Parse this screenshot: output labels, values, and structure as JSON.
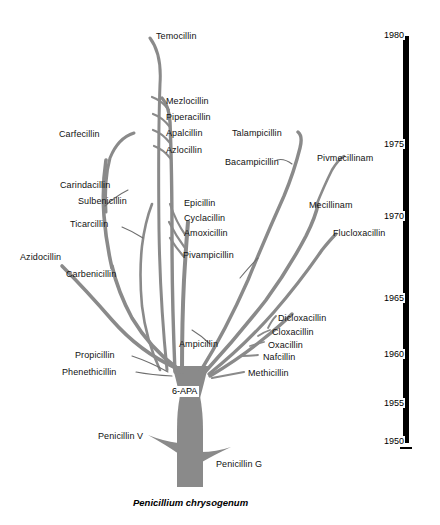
{
  "figure": {
    "title": "",
    "root_label": "Penicillium chrysogenum",
    "core_label": "6-APA",
    "branch_color": "#8a8a8a",
    "leader_color": "#6e6e6e",
    "text_color": "#111111",
    "timeline_color": "#000000",
    "background": "#ffffff"
  },
  "timeline": {
    "orientation": "vertical",
    "years": [
      "1980",
      "1975",
      "1970",
      "1965",
      "1960",
      "1955",
      "1950"
    ],
    "ticks": [
      {
        "label": "1980",
        "y": 36
      },
      {
        "label": "1975",
        "y": 145
      },
      {
        "label": "1970",
        "y": 217
      },
      {
        "label": "1965",
        "y": 299
      },
      {
        "label": "1960",
        "y": 355
      },
      {
        "label": "1955",
        "y": 404
      },
      {
        "label": "1950",
        "y": 442
      }
    ]
  },
  "labels": [
    {
      "name": "temocillin",
      "text": "Temocillin",
      "x": 156,
      "y": 31,
      "align": "left"
    },
    {
      "name": "mezlocillin",
      "text": "Mezlocillin",
      "x": 166,
      "y": 96,
      "align": "left"
    },
    {
      "name": "piperacillin",
      "text": "Piperacillin",
      "x": 166,
      "y": 112,
      "align": "left"
    },
    {
      "name": "apalcillin",
      "text": "Apalcillin",
      "x": 166,
      "y": 128,
      "align": "left"
    },
    {
      "name": "azlocillin",
      "text": "Azlocillin",
      "x": 166,
      "y": 145,
      "align": "left"
    },
    {
      "name": "carfecillin",
      "text": "Carfecillin",
      "x": 59,
      "y": 129,
      "align": "left"
    },
    {
      "name": "carindacillin",
      "text": "Carindacillin",
      "x": 60,
      "y": 180,
      "align": "left"
    },
    {
      "name": "sulbenicillin",
      "text": "Sulbenicillin",
      "x": 78,
      "y": 196,
      "align": "left"
    },
    {
      "name": "ticarcillin",
      "text": "Ticarcillin",
      "x": 70,
      "y": 219,
      "align": "left"
    },
    {
      "name": "azidocillin",
      "text": "Azidocillin",
      "x": 20,
      "y": 252,
      "align": "left"
    },
    {
      "name": "carbenicillin",
      "text": "Carbenicillin",
      "x": 66,
      "y": 269,
      "align": "left"
    },
    {
      "name": "epicillin",
      "text": "Epicillin",
      "x": 184,
      "y": 198,
      "align": "left"
    },
    {
      "name": "cyclacillin",
      "text": "Cyclacillin",
      "x": 184,
      "y": 213,
      "align": "left"
    },
    {
      "name": "amoxicillin",
      "text": "Amoxicillin",
      "x": 184,
      "y": 228,
      "align": "left"
    },
    {
      "name": "pivampicillin",
      "text": "Pivampicillin",
      "x": 183,
      "y": 250,
      "align": "left"
    },
    {
      "name": "talampicillin",
      "text": "Talampicillin",
      "x": 232,
      "y": 128,
      "align": "left"
    },
    {
      "name": "bacampicillin",
      "text": "Bacampicillin",
      "x": 225,
      "y": 157,
      "align": "left"
    },
    {
      "name": "pivmecillinam",
      "text": "Pivmecillinam",
      "x": 317,
      "y": 153,
      "align": "left"
    },
    {
      "name": "mecillinam",
      "text": "Mecillinam",
      "x": 309,
      "y": 200,
      "align": "left"
    },
    {
      "name": "flucloxacillin",
      "text": "Flucloxacillin",
      "x": 333,
      "y": 228,
      "align": "left"
    },
    {
      "name": "dicloxacillin",
      "text": "Dicloxacillin",
      "x": 278,
      "y": 313,
      "align": "left"
    },
    {
      "name": "cloxacillin",
      "text": "Cloxacillin",
      "x": 272,
      "y": 327,
      "align": "left"
    },
    {
      "name": "oxacillin",
      "text": "Oxacillin",
      "x": 268,
      "y": 340,
      "align": "left"
    },
    {
      "name": "nafcillin",
      "text": "Nafcillin",
      "x": 263,
      "y": 352,
      "align": "left"
    },
    {
      "name": "methicillin",
      "text": "Methicillin",
      "x": 248,
      "y": 368,
      "align": "left"
    },
    {
      "name": "ampicillin",
      "text": "Ampicillin",
      "x": 179,
      "y": 339,
      "align": "left"
    },
    {
      "name": "propicillin",
      "text": "Propicillin",
      "x": 75,
      "y": 350,
      "align": "left"
    },
    {
      "name": "phenethicillin",
      "text": "Phenethicillin",
      "x": 62,
      "y": 367,
      "align": "left"
    },
    {
      "name": "penicillin-v",
      "text": "Penicillin V",
      "x": 98,
      "y": 431,
      "align": "left"
    },
    {
      "name": "penicillin-g",
      "text": "Penicillin G",
      "x": 216,
      "y": 459,
      "align": "left"
    }
  ],
  "chart_data": {
    "type": "diagram",
    "subtype": "phylogenetic-style development tree",
    "root": "Penicillium chrysogenum",
    "core": "6-APA",
    "xlabel": "",
    "ylabel": "Year of introduction",
    "ylim": [
      1950,
      1980
    ],
    "ytick_step": 5,
    "yticks": [
      1950,
      1955,
      1960,
      1965,
      1970,
      1975,
      1980
    ],
    "legend": "none",
    "grid": false,
    "nodes": [
      {
        "name": "Penicillium chrysogenum",
        "year": null,
        "group": "source"
      },
      {
        "name": "Penicillin G",
        "year": 1950,
        "group": "natural"
      },
      {
        "name": "Penicillin V",
        "year": 1953,
        "group": "natural"
      },
      {
        "name": "6-APA",
        "year": 1957,
        "group": "core"
      },
      {
        "name": "Phenethicillin",
        "year": 1959,
        "group": "acid-stable"
      },
      {
        "name": "Propicillin",
        "year": 1960,
        "group": "acid-stable"
      },
      {
        "name": "Methicillin",
        "year": 1960,
        "group": "antistaphylococcal"
      },
      {
        "name": "Nafcillin",
        "year": 1961,
        "group": "antistaphylococcal"
      },
      {
        "name": "Oxacillin",
        "year": 1962,
        "group": "antistaphylococcal"
      },
      {
        "name": "Cloxacillin",
        "year": 1963,
        "group": "antistaphylococcal"
      },
      {
        "name": "Dicloxacillin",
        "year": 1965,
        "group": "antistaphylococcal"
      },
      {
        "name": "Flucloxacillin",
        "year": 1970,
        "group": "antistaphylococcal"
      },
      {
        "name": "Ampicillin",
        "year": 1961,
        "group": "aminopenicillin"
      },
      {
        "name": "Pivampicillin",
        "year": 1966,
        "group": "aminopenicillin"
      },
      {
        "name": "Amoxicillin",
        "year": 1969,
        "group": "aminopenicillin"
      },
      {
        "name": "Cyclacillin",
        "year": 1970,
        "group": "aminopenicillin"
      },
      {
        "name": "Epicillin",
        "year": 1971,
        "group": "aminopenicillin"
      },
      {
        "name": "Bacampicillin",
        "year": 1974,
        "group": "aminopenicillin"
      },
      {
        "name": "Talampicillin",
        "year": 1976,
        "group": "aminopenicillin"
      },
      {
        "name": "Carbenicillin",
        "year": 1964,
        "group": "carboxypenicillin"
      },
      {
        "name": "Azidocillin",
        "year": 1965,
        "group": "acid-stable"
      },
      {
        "name": "Ticarcillin",
        "year": 1969,
        "group": "carboxypenicillin"
      },
      {
        "name": "Sulbenicillin",
        "year": 1971,
        "group": "carboxypenicillin"
      },
      {
        "name": "Carindacillin",
        "year": 1972,
        "group": "carboxypenicillin"
      },
      {
        "name": "Carfecillin",
        "year": 1976,
        "group": "carboxypenicillin"
      },
      {
        "name": "Azlocillin",
        "year": 1974,
        "group": "ureidopenicillin"
      },
      {
        "name": "Apalcillin",
        "year": 1975,
        "group": "ureidopenicillin"
      },
      {
        "name": "Piperacillin",
        "year": 1976,
        "group": "ureidopenicillin"
      },
      {
        "name": "Mezlocillin",
        "year": 1977,
        "group": "ureidopenicillin"
      },
      {
        "name": "Temocillin",
        "year": 1980,
        "group": "carboxypenicillin"
      },
      {
        "name": "Mecillinam",
        "year": 1971,
        "group": "amidinopenicillin"
      },
      {
        "name": "Pivmecillinam",
        "year": 1975,
        "group": "amidinopenicillin"
      }
    ]
  }
}
